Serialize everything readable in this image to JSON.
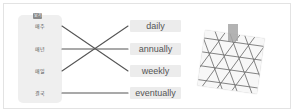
{
  "exercise": {
    "badge": "보기",
    "korean_words": [
      "매주",
      "매년",
      "매일",
      "결국"
    ],
    "english_words": [
      "daily",
      "annually",
      "weekly",
      "eventually"
    ],
    "matches": [
      {
        "from": "매주",
        "to": "weekly"
      },
      {
        "from": "매년",
        "to": "annually"
      },
      {
        "from": "매일",
        "to": "daily"
      },
      {
        "from": "결국",
        "to": "eventually"
      }
    ]
  },
  "photo": {
    "description": "taped photo of geometric lattice pattern"
  },
  "colors": {
    "panel": "#efefef",
    "word_box": "#ececec",
    "line": "#555555",
    "badge": "#8a8a8a"
  }
}
